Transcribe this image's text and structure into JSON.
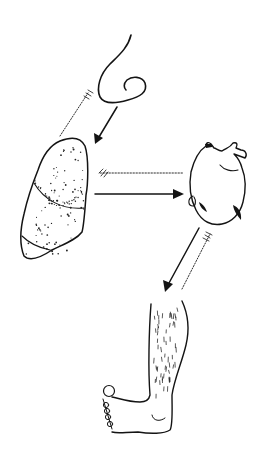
{
  "figure": {
    "nodes": [
      {
        "id": "nose",
        "label": "nose"
      },
      {
        "id": "lungs",
        "label": "lungs"
      },
      {
        "id": "heart",
        "label": "heart"
      },
      {
        "id": "leg",
        "label": "leg"
      }
    ],
    "edges": [
      {
        "from": "nose",
        "to": "lungs",
        "style": "solid-arrow"
      },
      {
        "from": "lungs",
        "to": "nose",
        "style": "dotted-feathered"
      },
      {
        "from": "lungs",
        "to": "heart",
        "style": "solid-arrow"
      },
      {
        "from": "heart",
        "to": "lungs",
        "style": "dotted-feathered"
      },
      {
        "from": "heart",
        "to": "leg",
        "style": "solid-arrow"
      },
      {
        "from": "leg",
        "to": "heart",
        "style": "dotted-feathered"
      }
    ],
    "colors": {
      "ink": "#141414",
      "background": "#ffffff",
      "bleed_text": "#d8d8d8"
    }
  }
}
